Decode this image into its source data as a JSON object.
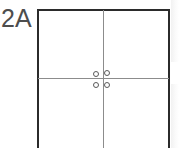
{
  "figure": {
    "label": "2A",
    "title": "2A",
    "type": "line-drawing"
  },
  "colors": {
    "background": "#ffffff",
    "outer_frame": "#2b2b2b",
    "divider_line": "#8c8c8c",
    "circle_stroke": "#5a5a5a",
    "label_text": "#4d4d4d",
    "scan_artifact": "#f2f2f2"
  },
  "frame": {
    "name": "panel-outline",
    "left": 37,
    "top": 9,
    "width": 133,
    "height": 145,
    "bottom_edge": "cropped",
    "stroke_width": 2
  },
  "dividers": [
    {
      "name": "vertical-divider",
      "orientation": "vertical",
      "position_x": 103,
      "from_y": 10,
      "to_y": 148,
      "stroke_width": 1
    },
    {
      "name": "horizontal-divider",
      "orientation": "horizontal",
      "position_y": 78,
      "from_x": 38,
      "to_x": 169,
      "stroke_width": 1
    }
  ],
  "circles": [
    {
      "name": "circle-top-left",
      "cx": 96,
      "cy": 74,
      "r": 3
    },
    {
      "name": "circle-top-right",
      "cx": 107,
      "cy": 73,
      "r": 3
    },
    {
      "name": "circle-bottom-left",
      "cx": 96,
      "cy": 85,
      "r": 3
    },
    {
      "name": "circle-bottom-right",
      "cx": 107,
      "cy": 85,
      "r": 3
    }
  ],
  "quadrants": [
    {
      "name": "quadrant-top-left"
    },
    {
      "name": "quadrant-top-right"
    },
    {
      "name": "quadrant-bottom-left"
    },
    {
      "name": "quadrant-bottom-right"
    }
  ]
}
